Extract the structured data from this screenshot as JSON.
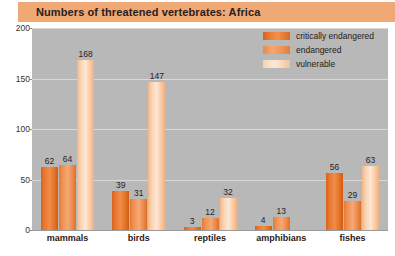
{
  "header": {
    "title": "Numbers of threatened vertebrates: Africa"
  },
  "legend": {
    "position": "top-right",
    "items": [
      {
        "label": "critically endangered",
        "color": "#e8762e"
      },
      {
        "label": "endangered",
        "color": "#f0955e"
      },
      {
        "label": "vulnerable",
        "color": "#fbdcc0"
      }
    ]
  },
  "axes": {
    "y_ticks": [
      "0",
      "50",
      "100",
      "150",
      "200"
    ],
    "x_categories": [
      "mammals",
      "birds",
      "reptiles",
      "amphibians",
      "fishes"
    ]
  },
  "chart_data": {
    "type": "bar",
    "title": "Numbers of threatened vertebrates: Africa",
    "xlabel": "",
    "ylabel": "",
    "ylim": [
      0,
      200
    ],
    "yticks": [
      0,
      50,
      100,
      150,
      200
    ],
    "grid": true,
    "legend_position": "top-right",
    "categories": [
      "mammals",
      "birds",
      "reptiles",
      "amphibians",
      "fishes"
    ],
    "series": [
      {
        "name": "critically endangered",
        "color": "#e8762e",
        "values": [
          62,
          39,
          3,
          4,
          56
        ]
      },
      {
        "name": "endangered",
        "color": "#f0955e",
        "values": [
          64,
          31,
          12,
          13,
          29
        ]
      },
      {
        "name": "vulnerable",
        "color": "#fbdcc0",
        "values": [
          168,
          147,
          32,
          null,
          63
        ]
      }
    ],
    "value_labels": [
      [
        "62",
        "64",
        "168"
      ],
      [
        "39",
        "31",
        "147"
      ],
      [
        "3",
        "12",
        "32"
      ],
      [
        "4",
        "13",
        null
      ],
      [
        "56",
        "29",
        "63"
      ]
    ]
  },
  "colors": {
    "title_bar": "#f0a875",
    "plot_background": "#b8b8b8",
    "gridline": "#d8d8d8",
    "page_background": "#ffffff"
  }
}
